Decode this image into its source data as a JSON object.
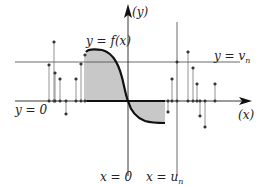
{
  "diagram": {
    "labels": {
      "y_axis": "(y)",
      "x_axis": "(x)",
      "curve": "y = f(x)",
      "v_line": "y = v",
      "v_line_sub": "n",
      "zero_line": "y = 0",
      "x_zero": "x = 0",
      "u_line": "x = u",
      "u_line_sub": "n"
    },
    "colors": {
      "axis": "#222222",
      "curve": "#111111",
      "shade": "#c8c8c8",
      "stem": "#555555",
      "guide": "#444444"
    },
    "stems_left": [
      {
        "x": 49,
        "y": 65
      },
      {
        "x": 54,
        "y": 42
      },
      {
        "x": 55,
        "y": 73
      },
      {
        "x": 60,
        "y": 79
      },
      {
        "x": 66,
        "y": 114
      },
      {
        "x": 76,
        "y": 79
      },
      {
        "x": 81,
        "y": 64
      },
      {
        "x": 85,
        "y": 55
      }
    ],
    "stems_right": [
      {
        "x": 168,
        "y": 112
      },
      {
        "x": 172,
        "y": 79
      },
      {
        "x": 188,
        "y": 52
      },
      {
        "x": 193,
        "y": 68
      },
      {
        "x": 197,
        "y": 84
      },
      {
        "x": 200,
        "y": 116
      },
      {
        "x": 205,
        "y": 127
      },
      {
        "x": 215,
        "y": 84
      }
    ]
  }
}
